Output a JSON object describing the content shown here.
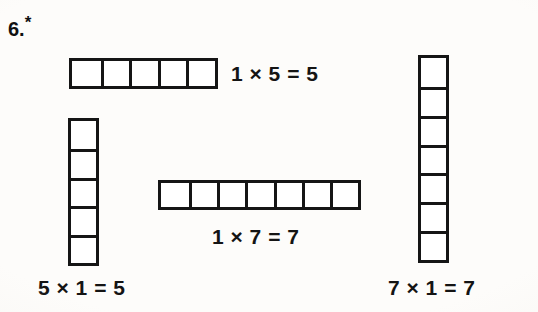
{
  "worksheet": {
    "exercise_number": "6.",
    "exercise_marker": "*",
    "background_color": "#fdfcfa",
    "ink_color": "#151515"
  },
  "arrays": [
    {
      "id": "array-top",
      "orientation": "horizontal",
      "rows": 1,
      "columns": 5,
      "cell_count": 5,
      "equation": "1 × 5 = 5",
      "equation_position": "right"
    },
    {
      "id": "array-left",
      "orientation": "vertical",
      "rows": 5,
      "columns": 1,
      "cell_count": 5,
      "equation": "5 × 1 = 5",
      "equation_position": "below"
    },
    {
      "id": "array-middle",
      "orientation": "horizontal",
      "rows": 1,
      "columns": 7,
      "cell_count": 7,
      "equation": "1 × 7 = 7",
      "equation_position": "below"
    },
    {
      "id": "array-right",
      "orientation": "vertical",
      "rows": 7,
      "columns": 1,
      "cell_count": 7,
      "equation": "7 × 1 = 7",
      "equation_position": "below"
    }
  ]
}
